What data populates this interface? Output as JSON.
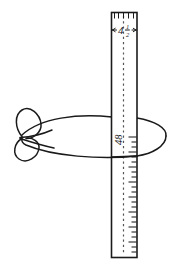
{
  "figure": {
    "background_color": "#ffffff",
    "ink_color": "#1b1b1b",
    "width": 187,
    "height": 271
  },
  "ruler": {
    "name": "vertical-measuring-stick",
    "top_scale_label": "4",
    "fraction_numerator": "1",
    "fraction_denominator": "2",
    "dimension_label_full": "4 1/2",
    "mid_label": "48",
    "mid_label_rotation_degrees": -90,
    "edge_color": "#1b1b1b",
    "face_color": "#ffffff",
    "centerline_color": "#555555",
    "centerline_style": "dashed",
    "tick_side": "right",
    "minor_tick_count": 44,
    "major_tick_every": 3,
    "top_tick_count": 5
  },
  "rope": {
    "name": "lasso-loop-with-bow-knot",
    "color": "#1a1a1a",
    "stroke_width": 1.5,
    "shape": "ellipse encircling ruler with double-loop bow at left"
  }
}
